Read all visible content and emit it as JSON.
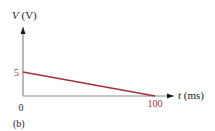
{
  "chart_data": {
    "type": "line",
    "title": "",
    "panel_label": "(b)",
    "xlabel_var": "t",
    "xlabel_unit": " (ms)",
    "ylabel_var": "V",
    "ylabel_unit": " (V)",
    "xlim": [
      0,
      120
    ],
    "ylim": [
      0,
      10
    ],
    "origin_label": "0",
    "x_ticks": [
      {
        "value": 100,
        "label": "100"
      }
    ],
    "y_ticks": [
      {
        "value": 5,
        "label": "5"
      }
    ],
    "grid": false,
    "legend": "none",
    "series": [
      {
        "name": "V(t)",
        "x": [
          0,
          100
        ],
        "y": [
          5,
          0
        ]
      }
    ],
    "colors": {
      "axis": "#1a1a1a",
      "line": "#a0303a",
      "tick_label": "#a0303a",
      "text": "#222222"
    }
  }
}
